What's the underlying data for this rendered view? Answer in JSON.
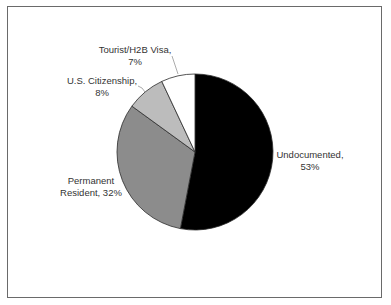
{
  "chart_data": {
    "type": "pie",
    "title": "",
    "start_angle": "12 o'clock, clockwise",
    "categories": [
      "Undocumented",
      "Permanent Resident",
      "U.S. Citizenship",
      "Tourist/H2B Visa"
    ],
    "values": [
      53,
      32,
      8,
      7
    ],
    "unit": "%",
    "colors": [
      "#000000",
      "#8c8c8c",
      "#bcbcbc",
      "#ffffff"
    ],
    "data_labels": [
      {
        "line1": "Undocumented,",
        "line2": "53%"
      },
      {
        "line1": "Permanent",
        "line2": "Resident, 32%"
      },
      {
        "line1": "U.S. Citizenship,",
        "line2": "8%"
      },
      {
        "line1": "Tourist/H2B Visa,",
        "line2": "7%"
      }
    ],
    "legend": "none (data labels)"
  }
}
